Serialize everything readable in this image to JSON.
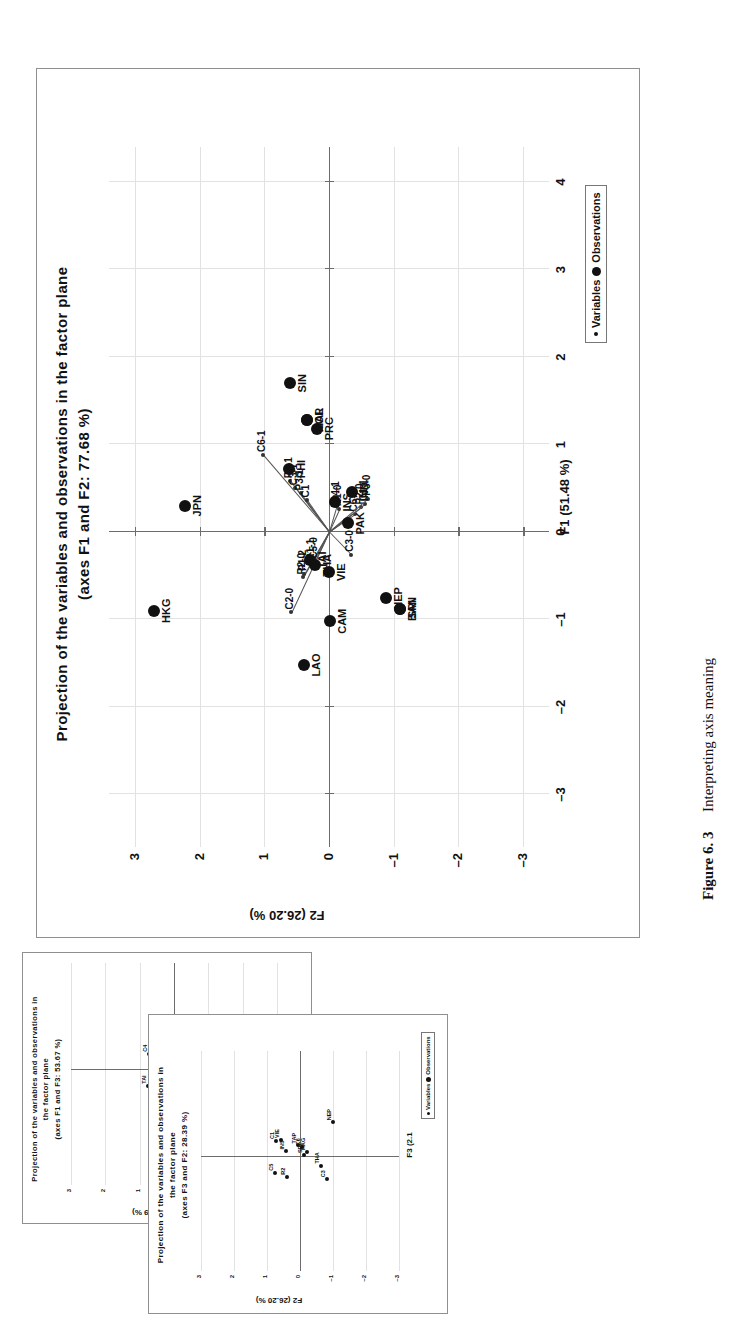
{
  "page": {
    "background": "#ffffff",
    "orientation_note": "figure printed rotated 90 degrees counter-clockwise"
  },
  "caption": {
    "figure_number": "Figure 6. 3",
    "text": "Interpreting axis meaning"
  },
  "legend": {
    "variables_label": "Variables",
    "observations_label": "Observations",
    "variables_marker": "small-dot-icon",
    "observations_marker": "large-dot-icon"
  },
  "main_chart": {
    "title_line1": "Projection of the variables and observations in the factor plane",
    "title_line2": "(axes F1 and F2: 77.68 %)"
  },
  "small_chart_1": {
    "title_line1": "Projection of the variables and observations in",
    "title_line2": "the factor plane",
    "title_line3": "(axes F1 and F3: 53.67 %)"
  },
  "small_chart_2": {
    "title_line1": "Projection of the variables and observations in",
    "title_line2": "the factor plane",
    "title_line3": "(axes F3 and F2: 28.39 %)"
  },
  "chart_data": [
    {
      "id": "main",
      "type": "scatter",
      "title": "Projection of the variables and observations in the factor plane (axes F1 and F2: 77.68 %)",
      "xlabel": "F1 (51.48 %)",
      "ylabel": "F2 (26.20 %)",
      "xlim": [
        -3.6,
        4.4
      ],
      "ylim": [
        -3.4,
        3.4
      ],
      "xticks": [
        -3,
        -2,
        -1,
        0,
        1,
        2,
        3,
        4
      ],
      "ytricks_note": "y ticks descend top to bottom",
      "yticks": [
        3,
        2,
        1,
        0,
        -1,
        -2,
        -3
      ],
      "grid": true,
      "legend_position": "bottom-right",
      "observations": [
        {
          "label": "SIN",
          "x": 1.7,
          "y": 0.6
        },
        {
          "label": "MAL",
          "x": 1.28,
          "y": 0.34
        },
        {
          "label": "KOR",
          "x": 1.28,
          "y": 0.34
        },
        {
          "label": "PRC",
          "x": 1.18,
          "y": 0.18
        },
        {
          "label": "JPN",
          "x": 0.3,
          "y": 2.22
        },
        {
          "label": "PHI",
          "x": 0.72,
          "y": 0.62
        },
        {
          "label": "HKG",
          "x": -0.9,
          "y": 2.7
        },
        {
          "label": "LAO",
          "x": -1.52,
          "y": 0.38
        },
        {
          "label": "CAM",
          "x": -1.02,
          "y": -0.02
        },
        {
          "label": "VIE",
          "x": -0.46,
          "y": 0.0
        },
        {
          "label": "THA",
          "x": -0.38,
          "y": 0.22
        },
        {
          "label": "TAI",
          "x": -0.32,
          "y": 0.3
        },
        {
          "label": "IND",
          "x": 0.46,
          "y": -0.36
        },
        {
          "label": "INS",
          "x": 0.34,
          "y": -0.1
        },
        {
          "label": "PAK",
          "x": 0.1,
          "y": -0.3
        },
        {
          "label": "NEP",
          "x": -0.76,
          "y": -0.88
        },
        {
          "label": "SRI",
          "x": -0.88,
          "y": -1.1
        },
        {
          "label": "BAN",
          "x": -0.88,
          "y": -1.1
        }
      ],
      "variables": [
        {
          "label": "C6-1",
          "x": 0.88,
          "y": 1.02
        },
        {
          "label": "P2-1",
          "x": 0.58,
          "y": 0.6
        },
        {
          "label": "C3-1",
          "x": 0.5,
          "y": 0.52
        },
        {
          "label": "P3-1",
          "x": 0.44,
          "y": 0.44
        },
        {
          "label": "C1",
          "x": 0.36,
          "y": 0.34
        },
        {
          "label": "C4-1",
          "x": 0.3,
          "y": -0.12
        },
        {
          "label": "R1-0",
          "x": 0.26,
          "y": -0.16
        },
        {
          "label": "C2-0",
          "x": -0.92,
          "y": 0.58
        },
        {
          "label": "R2-0",
          "x": -0.52,
          "y": 0.4
        },
        {
          "label": "P1-2",
          "x": -0.48,
          "y": 0.38
        },
        {
          "label": "R1-1",
          "x": -0.36,
          "y": 0.26
        },
        {
          "label": "C5-0",
          "x": -0.34,
          "y": 0.22
        },
        {
          "label": "C3-0",
          "x": -0.26,
          "y": -0.34
        },
        {
          "label": "C6-0",
          "x": 0.2,
          "y": -0.4
        },
        {
          "label": "P2-0",
          "x": 0.28,
          "y": -0.5
        },
        {
          "label": "C1-1",
          "x": 0.32,
          "y": -0.56
        },
        {
          "label": "P3-0",
          "x": 0.38,
          "y": -0.6
        }
      ]
    },
    {
      "id": "small-1",
      "type": "scatter",
      "title": "Projection of the variables and observations in the factor plane (axes F1 and F3: 53.67 %)",
      "ylabel": "F3 (2.19 %)",
      "yticks": [
        3,
        2,
        1,
        0,
        -1,
        -2,
        -3
      ],
      "grid": true,
      "labels_visible": [
        "LAO",
        "CAM",
        "C2-0",
        "P2",
        "C1",
        "R2",
        "C4",
        "C6",
        "NEP",
        "R1-1",
        "TAI",
        "TAP",
        "HKG"
      ]
    },
    {
      "id": "small-2",
      "type": "scatter",
      "title": "Projection of the variables and observations in the factor plane (axes F3 and F2: 28.39 %)",
      "xlabel": "F3 (2.1",
      "ylabel": "F2 (26.20 %)",
      "xticks": [
        -5,
        -4,
        -3,
        -2,
        -1
      ],
      "yticks": [
        3,
        2,
        1,
        0,
        -1,
        -2,
        -3
      ],
      "grid": true,
      "labels_visible": [
        "HKG",
        "R2",
        "SRI",
        "C3",
        "TAP",
        "THA",
        "C1",
        "INS",
        "VIE",
        "C6",
        "C5",
        "NEP"
      ]
    }
  ],
  "main_axes": {
    "x_title": "F1 (51.48 %)",
    "y_title": "F2 (26.20 %)",
    "xticks": [
      "-3",
      "-2",
      "-1",
      "0",
      "1",
      "2",
      "3",
      "4"
    ],
    "yticks": [
      "3",
      "2",
      "1",
      "0",
      "-1",
      "-2",
      "-3"
    ]
  },
  "small1_axes": {
    "y_title": "F3 (2.19 %)",
    "yticks": [
      "3",
      "2",
      "1",
      "0",
      "-1",
      "-2",
      "-3"
    ]
  },
  "small2_axes": {
    "x_title": "F3 (2.1",
    "y_title": "F2 (26.20 %)",
    "xticks": [
      "-5",
      "-4",
      "-3",
      "-2",
      "-1"
    ],
    "yticks": [
      "3",
      "2",
      "1",
      "0",
      "-1",
      "-2",
      "-3"
    ]
  }
}
